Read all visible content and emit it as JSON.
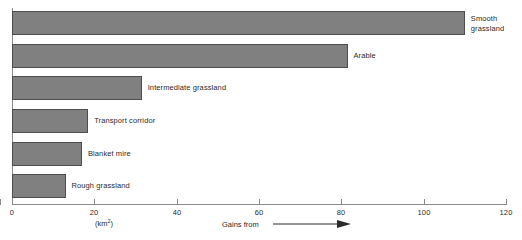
{
  "chart_data": {
    "type": "bar",
    "orientation": "horizontal",
    "title": "",
    "xlabel": "(km2)",
    "ylabel": "",
    "xlim": [
      0,
      120
    ],
    "xticks": [
      0,
      20,
      40,
      60,
      80,
      100,
      120
    ],
    "xtick_labels": [
      "0",
      "20",
      "40",
      "60",
      "80",
      "100",
      "120"
    ],
    "grid": false,
    "legend": false,
    "categories": [
      "Smooth grassland",
      "Arable",
      "Intermediate grassland",
      "Transport corridor",
      "Blanket mire",
      "Rough grassland"
    ],
    "values": [
      110,
      81.5,
      31.5,
      18.5,
      17,
      13
    ],
    "bar_color": "#808080",
    "bar_edge_color": "#4d4d4d",
    "axis_color": "#8a8a8a",
    "annotations": [
      {
        "text": "Gains from",
        "symbol": "right-arrow"
      }
    ]
  },
  "axis": {
    "unit_label_prefix": "(km",
    "unit_label_sup": "2",
    "unit_label_suffix": ")",
    "ticks": [
      {
        "label": "0",
        "value": 0
      },
      {
        "label": "20",
        "value": 20
      },
      {
        "label": "40",
        "value": 40
      },
      {
        "label": "60",
        "value": 60
      },
      {
        "label": "80",
        "value": 80
      },
      {
        "label": "100",
        "value": 100
      },
      {
        "label": "120",
        "value": 120
      }
    ]
  },
  "bars": [
    {
      "label_line1": "Smooth",
      "label_line2": "grassland",
      "value": 110
    },
    {
      "label_line1": "Arable",
      "label_line2": "",
      "value": 81.5
    },
    {
      "label_line1": "Intermediate grassland",
      "label_line2": "",
      "value": 31.5
    },
    {
      "label_line1": "Transport corridor",
      "label_line2": "",
      "value": 18.5
    },
    {
      "label_line1": "Blanket mire",
      "label_line2": "",
      "value": 17
    },
    {
      "label_line1": "Rough grassland",
      "label_line2": "",
      "value": 13
    }
  ],
  "annotation": {
    "gains_text": "Gains from"
  }
}
